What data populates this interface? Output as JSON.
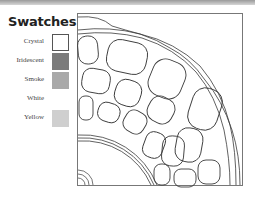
{
  "legend": {
    "title": "Swatches",
    "swatches": [
      {
        "label": "Crystal",
        "color": "#ffffff",
        "border": "#555555"
      },
      {
        "label": "Iridescent",
        "color": "#7b7b7b",
        "border": "none"
      },
      {
        "label": "Smoke",
        "color": "#a9a9a9",
        "border": "none"
      },
      {
        "label": "White",
        "color": "#ffffff",
        "border": "none"
      },
      {
        "label": "Yellow",
        "color": "#cfcfcf",
        "border": "none"
      }
    ]
  },
  "colors": {
    "line": "#3a3a3a",
    "frame": "#777777",
    "top_strip": "#b0b0b0"
  }
}
